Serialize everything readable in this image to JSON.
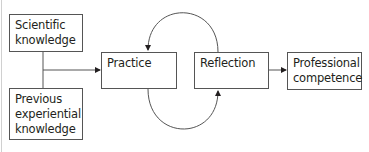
{
  "diagram": {
    "nodes": [
      {
        "id": "scientific",
        "label": "Scientific\nknowledge"
      },
      {
        "id": "previous",
        "label": "Previous\nexperiential\nknowledge"
      },
      {
        "id": "practice",
        "label": "Practice"
      },
      {
        "id": "reflection",
        "label": "Reflection"
      },
      {
        "id": "competence",
        "label": "Professional\ncompetence"
      }
    ],
    "edges": [
      {
        "from": "scientific + previous",
        "to": "practice"
      },
      {
        "from": "reflection",
        "to": "practice",
        "shape": "upper arc"
      },
      {
        "from": "practice",
        "to": "reflection",
        "shape": "lower arc"
      },
      {
        "from": "reflection",
        "to": "competence"
      }
    ]
  }
}
